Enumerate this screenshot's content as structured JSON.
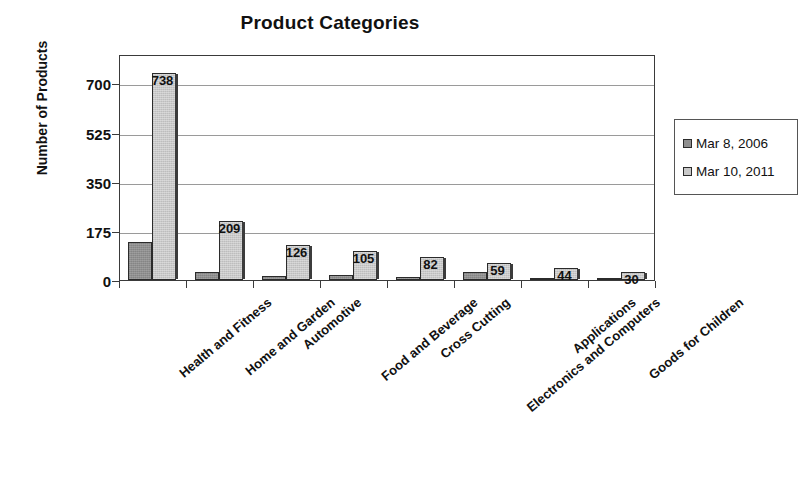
{
  "chart_data": {
    "type": "bar",
    "title": "Product Categories",
    "xlabel": "",
    "ylabel": "Number of Products",
    "ylim": [
      0,
      805
    ],
    "yticks": [
      0,
      175,
      350,
      525,
      700
    ],
    "grid": true,
    "legend_position": "right",
    "categories": [
      "Health and Fitness",
      "Home and Garden",
      "Automotive",
      "Food and Beverage",
      "Cross Cutting",
      "Electronics and Computers",
      "Applications",
      "Goods for Children"
    ],
    "series": [
      {
        "name": "Mar 8, 2006",
        "color": "#8f8f8f",
        "values": [
          135,
          27,
          13,
          18,
          9,
          30,
          8,
          3
        ],
        "labels": [
          "",
          "",
          "",
          "",
          "",
          "",
          "",
          ""
        ]
      },
      {
        "name": "Mar 10, 2011",
        "color": "#c9c9c9",
        "values": [
          738,
          209,
          126,
          105,
          82,
          59,
          44,
          30
        ],
        "labels": [
          "738",
          "209",
          "126",
          "105",
          "82",
          "59",
          "44",
          "30"
        ]
      }
    ]
  },
  "legend": {
    "items": [
      {
        "label": "Mar 8, 2006"
      },
      {
        "label": "Mar 10, 2011"
      }
    ]
  }
}
